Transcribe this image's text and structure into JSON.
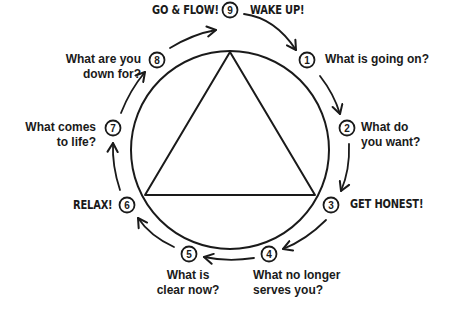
{
  "diagram": {
    "center": {
      "x": 230,
      "y": 150
    },
    "radius": 99,
    "triangle": {
      "apex": [
        230,
        52
      ],
      "left": [
        145,
        195
      ],
      "right": [
        315,
        195
      ]
    },
    "stroke_color": "#1a1a1a",
    "steps": [
      {
        "n": "1",
        "x": 307,
        "y": 60,
        "lines": [
          "What is going on?"
        ]
      },
      {
        "n": "2",
        "x": 347,
        "y": 128,
        "lines": [
          "What do",
          "you want?"
        ]
      },
      {
        "n": "3",
        "x": 331,
        "y": 205,
        "lines": [
          "GET HONEST!"
        ]
      },
      {
        "n": "4",
        "x": 269,
        "y": 254,
        "lines": [
          "What no longer",
          "serves you?"
        ]
      },
      {
        "n": "5",
        "x": 189,
        "y": 254,
        "lines": [
          "What is",
          "clear now?"
        ]
      },
      {
        "n": "6",
        "x": 127,
        "y": 205,
        "lines": [
          "RELAX!"
        ]
      },
      {
        "n": "7",
        "x": 113,
        "y": 128,
        "lines": [
          "What comes",
          "to life?"
        ]
      },
      {
        "n": "8",
        "x": 157,
        "y": 60,
        "lines": [
          "What are you",
          "down for?"
        ]
      },
      {
        "n": "9",
        "x": 230,
        "y": 10,
        "lines": []
      }
    ],
    "top_labels": {
      "left": "GO & FLOW!",
      "right": "WAKE UP!"
    }
  }
}
